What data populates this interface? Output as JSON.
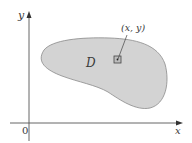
{
  "figure": {
    "axes": {
      "x_label": "x",
      "y_label": "y",
      "origin_label": "0"
    },
    "region": {
      "label": "D",
      "fill_color": "#d3d3d3",
      "stroke_color": "#8a8a8a"
    },
    "point": {
      "label": "(x, y)"
    },
    "colors": {
      "axis": "#555555",
      "text": "#3a3a3a"
    }
  }
}
